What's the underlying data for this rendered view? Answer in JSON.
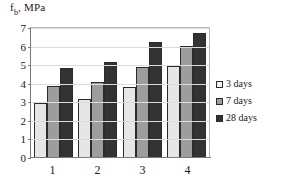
{
  "chart_data": {
    "type": "bar",
    "title": "",
    "ylabel": "fb, MPa",
    "ylabel_base": "f",
    "ylabel_sub": "b",
    "ylabel_rest": ", MPa",
    "xlabel": "",
    "categories": [
      "1",
      "2",
      "3",
      "4"
    ],
    "series": [
      {
        "name": "3 days",
        "color": "#e6e6e6",
        "values": [
          2.9,
          3.15,
          3.75,
          4.9
        ]
      },
      {
        "name": "7 days",
        "color": "#9d9d9d",
        "values": [
          3.85,
          4.05,
          4.85,
          6.0
        ]
      },
      {
        "name": "28 days",
        "color": "#333333",
        "values": [
          4.8,
          5.1,
          6.2,
          6.7
        ]
      }
    ],
    "ylim": [
      0,
      7
    ],
    "yticks": [
      0,
      1,
      2,
      3,
      4,
      5,
      6,
      7
    ],
    "ytick_labels": [
      "0",
      "1",
      "2",
      "3",
      "4",
      "5",
      "6",
      "7"
    ],
    "grid": true,
    "legend_position": "right"
  }
}
